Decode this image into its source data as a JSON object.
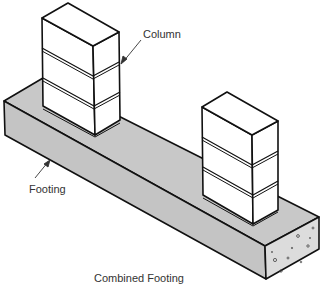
{
  "diagram": {
    "caption": "Combined Footing",
    "labels": {
      "column": "Column",
      "footing": "Footing"
    },
    "colors": {
      "footing_fill": "#c8c8c8",
      "footing_end_fill": "#dcdcdc",
      "column_fill": "#ffffff",
      "stroke": "#111111",
      "label_text": "#333333"
    },
    "components": [
      {
        "name": "Column",
        "count": 2,
        "blocks_per_column": 3
      },
      {
        "name": "Footing",
        "type": "combined concrete footing"
      }
    ]
  }
}
